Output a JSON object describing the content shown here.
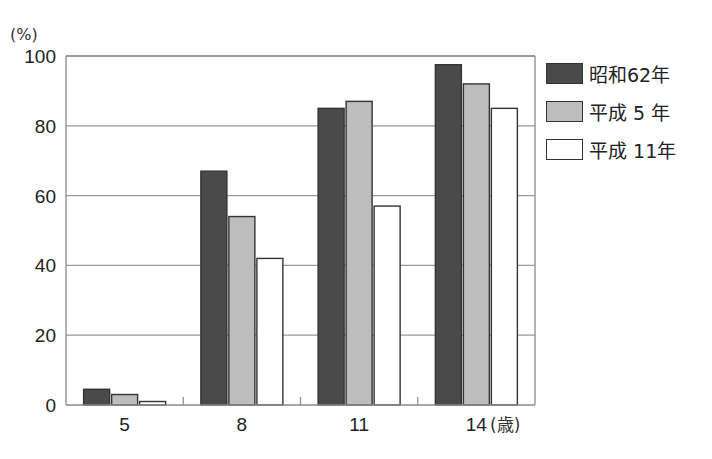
{
  "chart_data": {
    "type": "bar",
    "title": "",
    "ylabel": "(%)",
    "xlabel": "(歳)",
    "ylim": [
      0,
      100
    ],
    "yticks": [
      0,
      20,
      40,
      60,
      80,
      100
    ],
    "categories": [
      "5",
      "8",
      "11",
      "14"
    ],
    "grid": true,
    "legend_position": "right",
    "series": [
      {
        "name": "昭和62年",
        "color": "#4a4a4a",
        "values": [
          4.5,
          67,
          85,
          97.5
        ]
      },
      {
        "name": "平成 5 年",
        "color": "#bdbdbd",
        "values": [
          3,
          54,
          87,
          92
        ]
      },
      {
        "name": "平成 11年",
        "color": "#ffffff",
        "values": [
          1,
          42,
          57,
          85
        ]
      }
    ]
  },
  "legend": {
    "items": [
      {
        "label": "昭和62年",
        "color": "#4a4a4a"
      },
      {
        "label": "平成 5 年",
        "color": "#bdbdbd"
      },
      {
        "label": "平成 11年",
        "color": "#ffffff"
      }
    ]
  }
}
